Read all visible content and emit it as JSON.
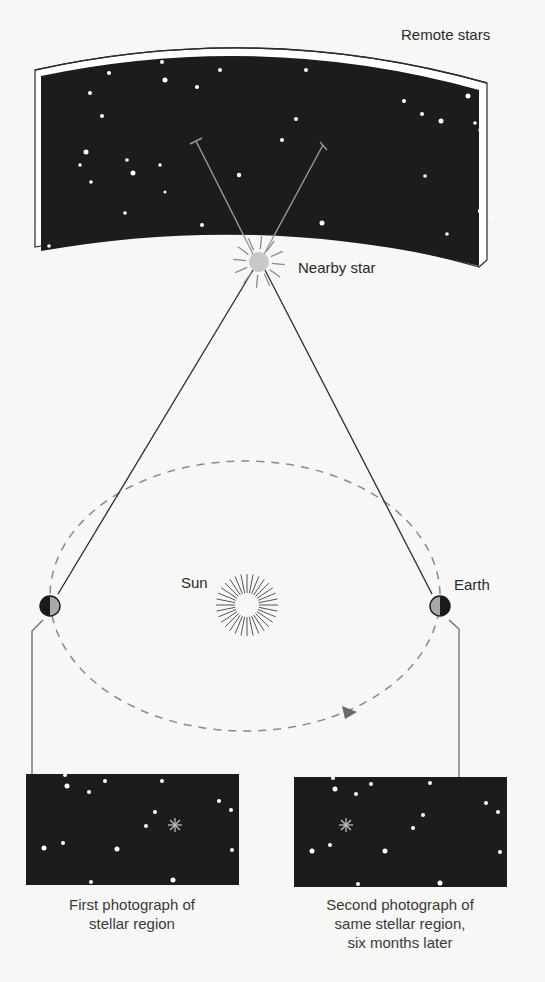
{
  "labels": {
    "remote_stars": "Remote stars",
    "nearby_star": "Nearby star",
    "sun": "Sun",
    "earth": "Earth"
  },
  "captions": {
    "first": [
      "First photograph of",
      "stellar region"
    ],
    "second": [
      "Second photograph of",
      "same stellar region,",
      "six months later"
    ]
  },
  "colors": {
    "background": "#f7f7f5",
    "sky": "#1c1c1c",
    "star": "#ffffff",
    "nearby_star": "#c8c8c8",
    "line": "#3a3a3a",
    "orbit": "#8a8a8a",
    "earth_dark": "#1a1a1a",
    "earth_light": "#a8a8a8"
  },
  "sky_slab": {
    "remote_stars": [
      [
        162,
        62,
        2
      ],
      [
        109,
        73,
        2
      ],
      [
        165,
        80,
        2.5
      ],
      [
        197,
        87,
        2
      ],
      [
        220,
        70,
        2
      ],
      [
        90,
        93,
        2
      ],
      [
        102,
        116,
        2
      ],
      [
        306,
        70,
        2
      ],
      [
        296,
        119,
        2
      ],
      [
        282,
        140,
        2
      ],
      [
        86,
        152,
        2.5
      ],
      [
        80,
        165,
        1.8
      ],
      [
        127,
        160,
        1.8
      ],
      [
        160,
        165,
        1.8
      ],
      [
        133,
        173,
        2.5
      ],
      [
        91,
        182,
        1.8
      ],
      [
        165,
        192,
        1.5
      ],
      [
        239,
        175,
        2.2
      ],
      [
        125,
        213,
        1.8
      ],
      [
        202,
        225,
        2
      ],
      [
        322,
        223,
        2.5
      ],
      [
        49,
        246,
        1.8
      ],
      [
        404,
        101,
        2
      ],
      [
        422,
        114,
        2
      ],
      [
        441,
        121,
        2.5
      ],
      [
        468,
        96,
        2.5
      ],
      [
        475,
        123,
        1.8
      ],
      [
        480,
        130,
        1.8
      ],
      [
        425,
        176,
        1.8
      ],
      [
        483,
        171,
        2.2
      ],
      [
        480,
        211,
        2.2
      ],
      [
        492,
        217,
        1.8
      ],
      [
        447,
        234,
        1.8
      ]
    ]
  },
  "orbit": {
    "cx": 245,
    "cy": 596,
    "rx": 195,
    "ry": 135
  },
  "earths": [
    {
      "x": 50,
      "y": 606,
      "dark_side": "left"
    },
    {
      "x": 440,
      "y": 606,
      "dark_side": "right"
    }
  ],
  "nearby_star": {
    "x": 259,
    "y": 262
  },
  "sun": {
    "x": 247,
    "y": 605
  },
  "photos": {
    "first": {
      "box": [
        26,
        774,
        213,
        111
      ],
      "stars": [
        [
          65,
          775,
          2
        ],
        [
          67,
          786,
          2.5
        ],
        [
          89,
          792,
          2
        ],
        [
          105,
          781,
          2
        ],
        [
          162,
          781,
          2
        ],
        [
          155,
          812,
          2
        ],
        [
          146,
          826,
          2
        ],
        [
          219,
          801,
          2
        ],
        [
          231,
          810,
          2
        ],
        [
          44,
          848,
          2.5
        ],
        [
          63,
          843,
          2
        ],
        [
          117,
          849,
          2.5
        ],
        [
          232,
          850,
          2
        ],
        [
          91,
          882,
          2
        ],
        [
          173,
          880,
          2.5
        ]
      ],
      "nearby": [
        175,
        825
      ]
    },
    "second": {
      "box": [
        294,
        777,
        213,
        110
      ],
      "stars": [
        [
          333,
          778,
          2
        ],
        [
          335,
          789,
          2.5
        ],
        [
          356,
          794,
          2
        ],
        [
          371,
          784,
          2
        ],
        [
          430,
          783,
          2
        ],
        [
          423,
          815,
          2
        ],
        [
          413,
          828,
          2
        ],
        [
          486,
          803,
          2
        ],
        [
          498,
          812,
          2
        ],
        [
          312,
          851,
          2.5
        ],
        [
          330,
          845,
          2
        ],
        [
          385,
          851,
          2.5
        ],
        [
          500,
          852,
          2
        ],
        [
          358,
          884,
          2
        ],
        [
          440,
          883,
          2.5
        ]
      ],
      "nearby": [
        346,
        825
      ]
    }
  }
}
